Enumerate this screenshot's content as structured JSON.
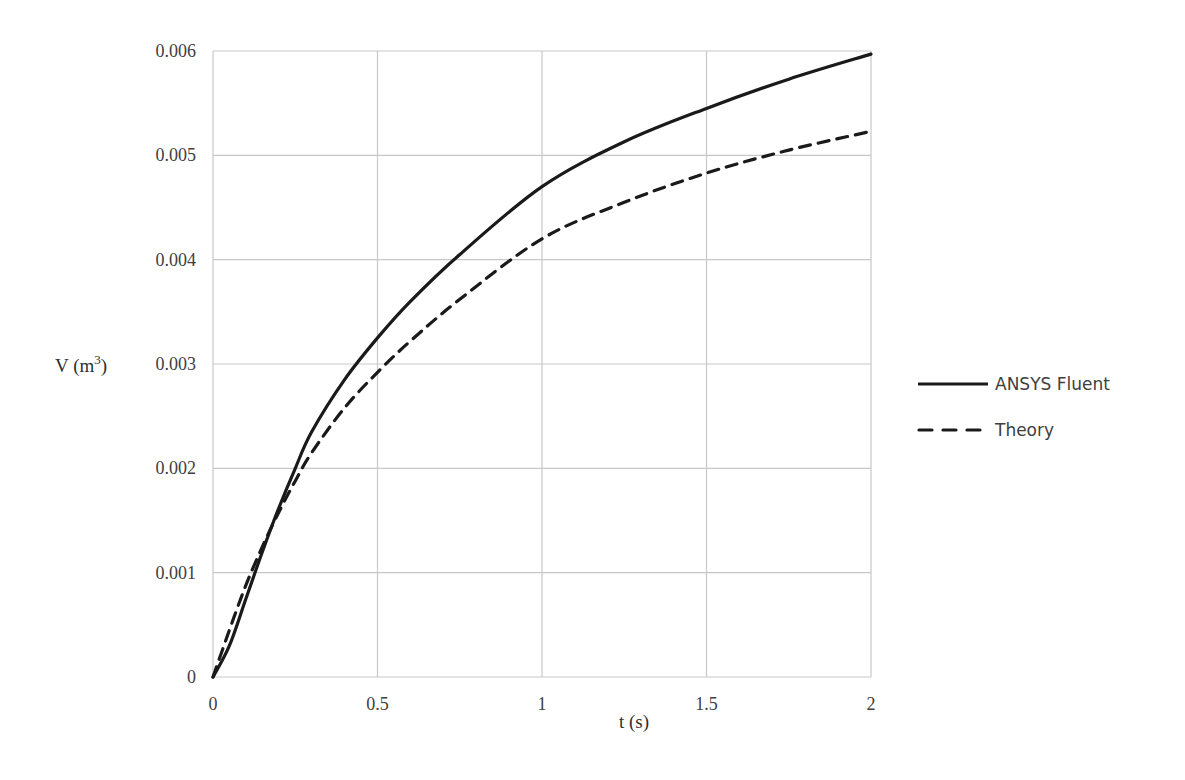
{
  "chart_data": {
    "type": "line",
    "title": "",
    "xlabel": "t (s)",
    "ylabel": "V (m³)",
    "ylabel_base": "V (m",
    "ylabel_sup": "3",
    "ylabel_close": ")",
    "xlim": [
      0,
      2
    ],
    "ylim": [
      0,
      0.006
    ],
    "grid": true,
    "legend_position": "right",
    "x_ticks": [
      "0",
      "0.5",
      "1",
      "1.5",
      "2"
    ],
    "y_ticks": [
      "0",
      "0.001",
      "0.002",
      "0.003",
      "0.004",
      "0.005",
      "0.006"
    ],
    "x": [
      0,
      0.05,
      0.1,
      0.15,
      0.2,
      0.25,
      0.3,
      0.4,
      0.5,
      0.6,
      0.75,
      1.0,
      1.25,
      1.5,
      1.75,
      2.0
    ],
    "series": [
      {
        "name": "ANSYS Fluent",
        "style": "solid",
        "color": "#1a1a1a",
        "values": [
          0,
          0.0003,
          0.00075,
          0.0012,
          0.00162,
          0.002,
          0.00235,
          0.00285,
          0.00325,
          0.0036,
          0.00405,
          0.0047,
          0.00513,
          0.00545,
          0.00573,
          0.00597
        ]
      },
      {
        "name": "Theory",
        "style": "dashed",
        "color": "#1a1a1a",
        "values": [
          0,
          0.00045,
          0.00088,
          0.00125,
          0.00158,
          0.00188,
          0.00215,
          0.00258,
          0.00292,
          0.00322,
          0.00362,
          0.0042,
          0.00455,
          0.00483,
          0.00505,
          0.00523
        ]
      }
    ]
  }
}
